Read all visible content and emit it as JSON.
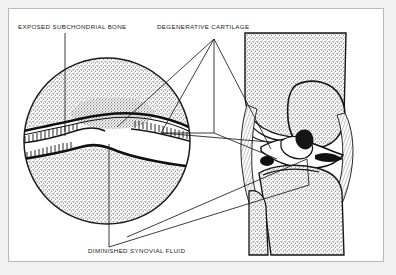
{
  "figure": {
    "background_color": "#f2f2f2",
    "panel_color": "#ffffff",
    "border_color": "#b9b9b9",
    "ink_color": "#1a1a1a",
    "bone_stipple_color": "#8c8c8c"
  },
  "labels": [
    {
      "id": "exposed-subchondrial-bone",
      "text": "EXPOSED SUBCHONDRIAL BONE"
    },
    {
      "id": "degenerative-cartilage",
      "text": "DEGENERATIVE CARTILAGE"
    },
    {
      "id": "diminished-synovial-fluid",
      "text": "DIMINISHED SYNOVIAL FLUID"
    }
  ],
  "views": {
    "magnified_inset": {
      "name": "magnified-joint-detail",
      "shape": "circle",
      "center_x": 98,
      "center_y": 132,
      "radius": 84,
      "contents": [
        "femoral-subchondral-bone",
        "degenerated-cartilage-layer",
        "narrowed-joint-space",
        "tibial-subchondral-bone"
      ]
    },
    "knee_anatomy": {
      "name": "lateral-knee-cross-section",
      "contents": [
        "femur",
        "patella",
        "joint-space",
        "meniscus",
        "tibia",
        "fibula",
        "ligaments"
      ]
    }
  },
  "caption": ""
}
